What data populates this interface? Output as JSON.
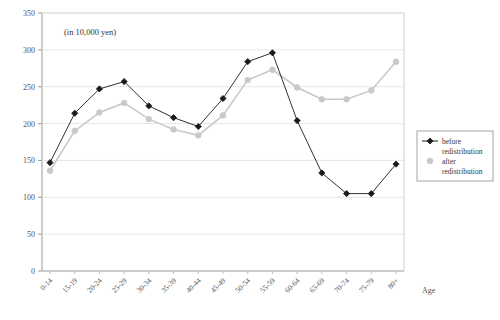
{
  "chart_data": {
    "type": "line",
    "title": "",
    "unit_note": "(in 10,000 yen)",
    "xlabel": "Age",
    "ylabel": "",
    "ylim": [
      0,
      350
    ],
    "yticks": [
      0,
      50,
      100,
      150,
      200,
      250,
      300,
      350
    ],
    "grid": true,
    "legend_position": "right",
    "categories": [
      "0-14",
      "15-19",
      "20-24",
      "25-29",
      "30-34",
      "35-39",
      "40-44",
      "45-49",
      "50-54",
      "55-59",
      "60-64",
      "65-69",
      "70-74",
      "75-79",
      "80+"
    ],
    "series": [
      {
        "name": "before redistribution",
        "color": "#1a1a1a",
        "marker": "diamond",
        "values": [
          147,
          214,
          247,
          257,
          224,
          208,
          196,
          234,
          284,
          296,
          204,
          133,
          105,
          105,
          145
        ]
      },
      {
        "name": "after redistribution",
        "color": "#c9c9c9",
        "marker": "circle",
        "values": [
          136,
          190,
          215,
          228,
          206,
          192,
          184,
          211,
          259,
          273,
          249,
          233,
          233,
          245,
          284
        ]
      }
    ]
  },
  "legend": {
    "items": [
      {
        "label_line1": "before",
        "label_line2": "redistribution"
      },
      {
        "label_line1": "after",
        "label_line2": "redistribution"
      }
    ]
  }
}
